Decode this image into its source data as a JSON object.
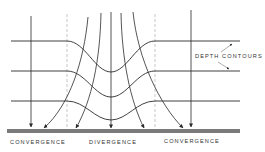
{
  "diagram": {
    "labels": {
      "depth_contours": "DEPTH CONTOURS",
      "left": "CONVERGENCE",
      "center": "DIVERGENCE",
      "right": "CONVERGENCE"
    },
    "colors": {
      "line": "#2a2a2a",
      "dashed": "#b0b0b0",
      "shore": "#7a7a7a"
    }
  }
}
